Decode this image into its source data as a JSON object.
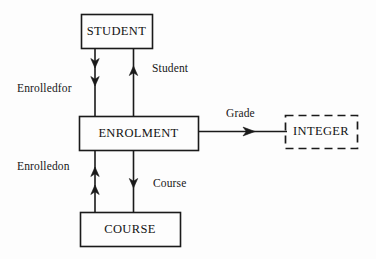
{
  "diagram": {
    "type": "entity-relationship",
    "background_color": "#fdfdfd",
    "line_color": "#1a1a1a",
    "text_color": "#121212",
    "entities": [
      {
        "id": "student",
        "label": "STUDENT",
        "shape": "rectangle",
        "border_style": "solid",
        "x": 81,
        "y": 14,
        "width": 71,
        "height": 34
      },
      {
        "id": "enrolment",
        "label": "ENROLMENT",
        "shape": "rectangle",
        "border_style": "solid",
        "x": 79,
        "y": 116,
        "width": 119,
        "height": 34
      },
      {
        "id": "course",
        "label": "COURSE",
        "shape": "rectangle",
        "border_style": "solid",
        "x": 80,
        "y": 212,
        "width": 100,
        "height": 34
      },
      {
        "id": "integer",
        "label": "INTEGER",
        "shape": "rectangle",
        "border_style": "dashed",
        "x": 285,
        "y": 115,
        "width": 72,
        "height": 33
      }
    ],
    "edge_labels": [
      {
        "id": "enrolledfor",
        "text": "Enrolledfor",
        "x": 17,
        "y": 82
      },
      {
        "id": "student-role",
        "text": "Student",
        "x": 152,
        "y": 62
      },
      {
        "id": "grade",
        "text": "Grade",
        "x": 226,
        "y": 107
      },
      {
        "id": "enrolledon",
        "text": "Enrolledon",
        "x": 17,
        "y": 160
      },
      {
        "id": "course-role",
        "text": "Course",
        "x": 153,
        "y": 177
      }
    ],
    "connectors": [
      {
        "id": "student-to-enrolment",
        "from": "student",
        "to": "enrolment",
        "direction": "down",
        "arrowheads": 2
      },
      {
        "id": "enrolment-to-student",
        "from": "enrolment",
        "to": "student",
        "direction": "up",
        "arrowheads": 1
      },
      {
        "id": "course-to-enrolment",
        "from": "course",
        "to": "enrolment",
        "direction": "up",
        "arrowheads": 2
      },
      {
        "id": "enrolment-to-course",
        "from": "enrolment",
        "to": "course",
        "direction": "down",
        "arrowheads": 1
      },
      {
        "id": "enrolment-to-integer",
        "from": "enrolment",
        "to": "integer",
        "direction": "right",
        "arrowheads": 1
      }
    ]
  }
}
